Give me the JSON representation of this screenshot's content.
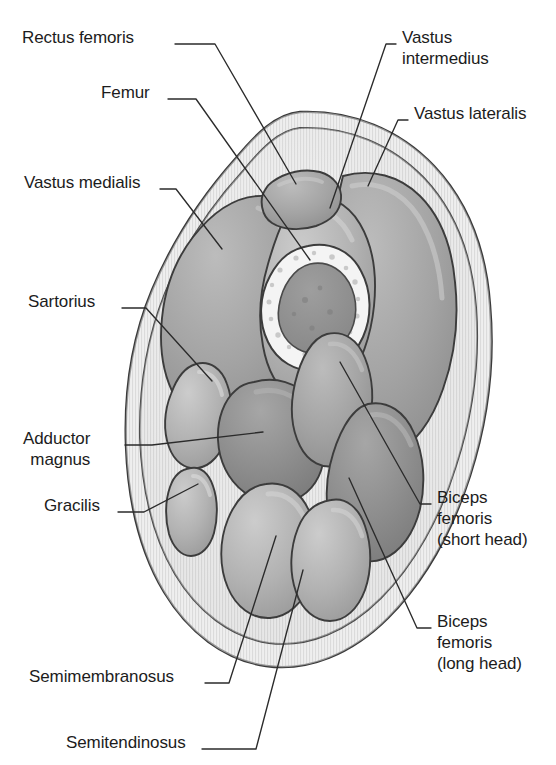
{
  "figure": {
    "view": "transverse section, right thigh, mid-shaft",
    "background_color": "#ffffff",
    "text_color": "#1c1c1c"
  },
  "palette": {
    "skin_outline": "#3a3a3a",
    "subcutaneous_fat": "#e2e2e2",
    "deep_fascia_fill": "#d8d8d8",
    "muscle_light": "#b2b2b2",
    "muscle_mid": "#a0a0a0",
    "muscle_dark": "#8b8b8b",
    "bone_cortex": "#f2f2f2",
    "bone_marrow": "#8e8e8e",
    "leader_line": "#2b2b2b"
  },
  "labels": [
    {
      "id": "rectus-femoris",
      "text": "Rectus femoris",
      "side": "left",
      "x": 22,
      "y": 27,
      "leader": "M 175,44 L 215,44 L 296,184"
    },
    {
      "id": "femur",
      "text": "Femur",
      "side": "left",
      "x": 101,
      "y": 82,
      "leader": "M 168,99 L 196,99 L 310,260"
    },
    {
      "id": "vastus-intermedius",
      "text": "Vastus\nintermedius",
      "side": "right",
      "x": 402,
      "y": 27,
      "leader": "M 396,44 L 386,44 L 330,208"
    },
    {
      "id": "vastus-lateralis",
      "text": "Vastus lateralis",
      "side": "right",
      "x": 414,
      "y": 103,
      "leader": "M 408,120 L 398,120 L 368,186"
    },
    {
      "id": "vastus-medialis",
      "text": "Vastus medialis",
      "side": "left",
      "x": 24,
      "y": 172,
      "leader": "M 160,189 L 176,189 L 222,249"
    },
    {
      "id": "sartorius",
      "text": "Sartorius",
      "side": "left",
      "x": 28,
      "y": 291,
      "leader": "M 122,308 L 146,308 L 212,381"
    },
    {
      "id": "adductor-magnus",
      "text": "Adductor\nmagnus",
      "side": "left",
      "x": 23,
      "y": 428,
      "leader": "M 125,445 L 152,445 L 263,432"
    },
    {
      "id": "gracilis",
      "text": "Gracilis",
      "side": "left",
      "x": 44,
      "y": 495,
      "leader": "M 118,512 L 144,512 L 198,484"
    },
    {
      "id": "biceps-femoris-short-head",
      "text": "Biceps\nfemoris\n(short head)",
      "side": "right",
      "x": 437,
      "y": 487,
      "leader": "M 431,504 L 420,504 L 340,362"
    },
    {
      "id": "biceps-femoris-long-head",
      "text": "Biceps\nfemoris\n(long head)",
      "side": "right",
      "x": 437,
      "y": 611,
      "leader": "M 431,628 L 417,628 L 349,478"
    },
    {
      "id": "semimembranosus",
      "text": "Semimembranosus",
      "side": "left",
      "x": 29,
      "y": 666,
      "leader": "M 205,683 L 229,683 L 276,536"
    },
    {
      "id": "semitendinosus",
      "text": "Semitendinosus",
      "side": "left",
      "x": 66,
      "y": 732,
      "leader": "M 202,749 L 256,749 L 303,570"
    }
  ],
  "structures": [
    {
      "id": "subcutaneous-layer",
      "name": "Subcutaneous fat and skin"
    },
    {
      "id": "deep-fascia",
      "name": "Deep fascia of thigh (fascia lata)"
    },
    {
      "id": "femur-cortex",
      "name": "Femur compact bone"
    },
    {
      "id": "femur-marrow",
      "name": "Femur medullary cavity"
    },
    {
      "id": "rectus-femoris-muscle",
      "name": "Rectus femoris"
    },
    {
      "id": "vastus-intermedius-muscle",
      "name": "Vastus intermedius"
    },
    {
      "id": "vastus-lateralis-muscle",
      "name": "Vastus lateralis"
    },
    {
      "id": "vastus-medialis-muscle",
      "name": "Vastus medialis"
    },
    {
      "id": "sartorius-muscle",
      "name": "Sartorius"
    },
    {
      "id": "adductor-magnus-muscle",
      "name": "Adductor magnus"
    },
    {
      "id": "gracilis-muscle",
      "name": "Gracilis"
    },
    {
      "id": "biceps-femoris-short-muscle",
      "name": "Biceps femoris (short head)"
    },
    {
      "id": "biceps-femoris-long-muscle",
      "name": "Biceps femoris (long head)"
    },
    {
      "id": "semimembranosus-muscle",
      "name": "Semimembranosus"
    },
    {
      "id": "semitendinosus-muscle",
      "name": "Semitendinosus"
    }
  ]
}
